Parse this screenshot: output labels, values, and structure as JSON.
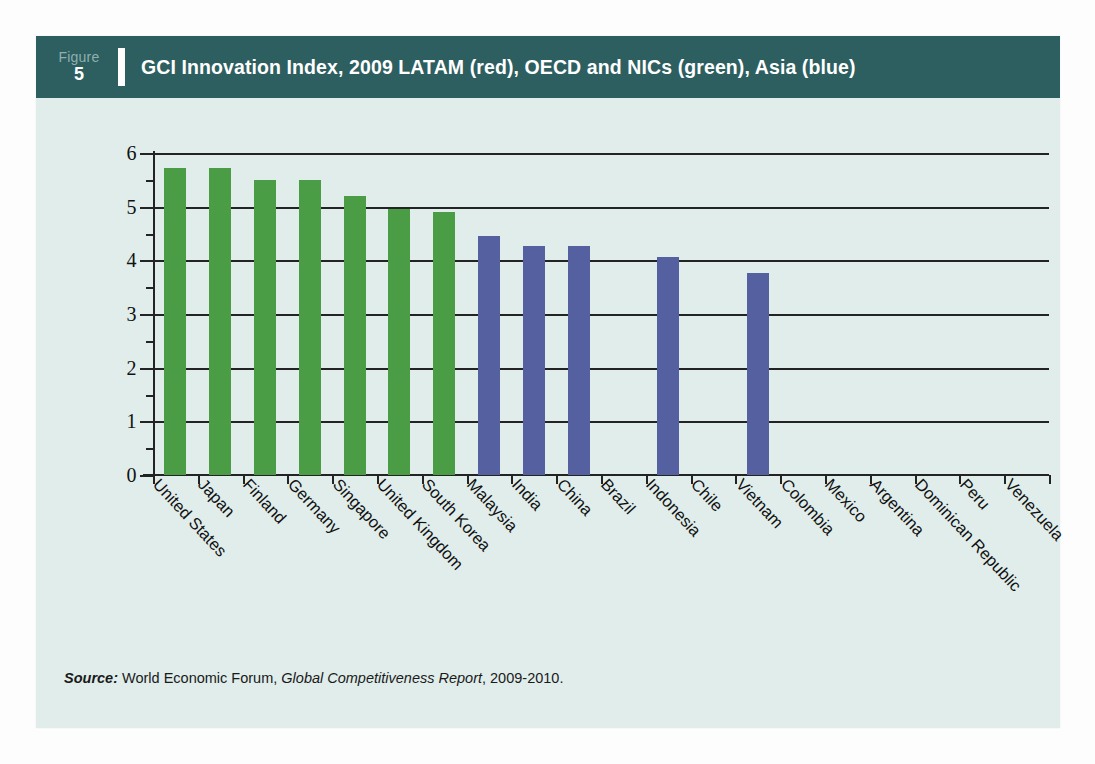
{
  "figure": {
    "tag_word": "Figure",
    "tag_number": "5",
    "title": "GCI Innovation Index, 2009 LATAM (red), OECD and NICs (green), Asia (blue)"
  },
  "source": {
    "label": "Source:",
    "publisher": " World Economic Forum, ",
    "report": "Global Competitiveness Report",
    "years": ", 2009-2010."
  },
  "colors": {
    "header_band": "#2d5e60",
    "card_background": "#e0edeb",
    "green": "#4a9c45",
    "blue": "#5560a0",
    "orange": "#f4602a",
    "axis": "#232323"
  },
  "chart_data": {
    "type": "bar",
    "title": "GCI Innovation Index, 2009 LATAM (red), OECD and NICs (green), Asia (blue)",
    "xlabel": "",
    "ylabel": "",
    "ylim": [
      0,
      6
    ],
    "yticks": [
      0,
      1,
      2,
      3,
      4,
      5,
      6
    ],
    "ytick_labels": [
      "0",
      "1",
      "2",
      "3",
      "4",
      "5",
      "6"
    ],
    "grid": true,
    "grid_axis": "y",
    "legend": "encoded-in-title",
    "groups": {
      "green": "OECD and NICs",
      "blue": "Asia",
      "red": "LATAM"
    },
    "categories": [
      "United States",
      "Japan",
      "Finland",
      "Germany",
      "Singapore",
      "United Kingdom",
      "South Korea",
      "Malaysia",
      "India",
      "China",
      "Brazil",
      "Indonesia",
      "Chile",
      "Vietnam",
      "Colombia",
      "Mexico",
      "Argentina",
      "Dominican Republic",
      "Peru",
      "Venezuela"
    ],
    "values": [
      5.72,
      5.72,
      5.5,
      5.5,
      5.19,
      4.96,
      4.9,
      4.45,
      4.26,
      4.27,
      4.14,
      4.06,
      4.04,
      3.77,
      3.73,
      3.64,
      3.53,
      3.48,
      3.46,
      2.84
    ],
    "colors": [
      "green",
      "green",
      "green",
      "green",
      "green",
      "green",
      "green",
      "blue",
      "blue",
      "blue",
      "red",
      "blue",
      "red",
      "blue",
      "red",
      "red",
      "red",
      "red",
      "red",
      "red"
    ]
  }
}
